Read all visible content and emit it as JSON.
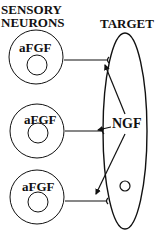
{
  "headers": {
    "sensory_line1": "SENSORY",
    "sensory_line2": "NEURONS",
    "target": "TARGET"
  },
  "neurons": [
    {
      "label": "aFGF",
      "cx": 36,
      "cy": 57,
      "r": 27,
      "inner_cx": 37,
      "inner_cy": 65,
      "inner_r": 10,
      "axon_y": 60
    },
    {
      "label": "aFGF",
      "cx": 37,
      "cy": 131,
      "r": 27,
      "inner_cx": 38,
      "inner_cy": 133,
      "inner_r": 10,
      "axon_y": 131
    },
    {
      "label": "aFGF",
      "cx": 37,
      "cy": 197,
      "r": 27,
      "inner_cx": 38,
      "inner_cy": 202,
      "inner_r": 10,
      "axon_y": 201
    }
  ],
  "target": {
    "factor_label": "NGF",
    "ellipse": {
      "cx": 125,
      "cy": 131,
      "rx": 22,
      "ry": 98
    },
    "nucleus": {
      "cx": 125,
      "cy": 186,
      "r": 5
    }
  },
  "colors": {
    "line": "#111111",
    "background": "#ffffff"
  }
}
